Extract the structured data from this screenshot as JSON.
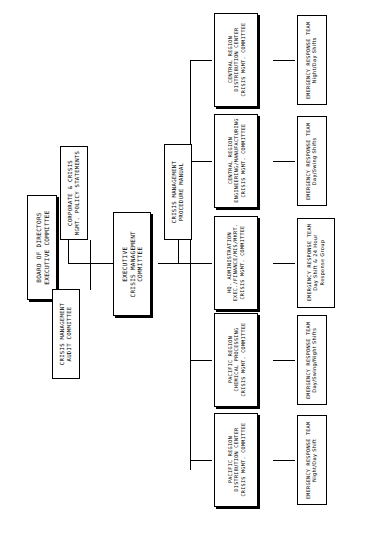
{
  "document": {
    "type": "organization-chart",
    "title": "Crisis Management Organization Chart",
    "orientation": "rotated-90-ccw"
  },
  "chart_data": {
    "type": "diagram",
    "node_count": 15,
    "levels": 4
  },
  "nodes": {
    "board": {
      "lines": [
        "BOARD OF DIRECTORS",
        "EXECUTIVE COMMITTEE"
      ]
    },
    "audit": {
      "lines": [
        "CRISIS MANAGEMENT",
        "AUDIT COMMITTEE"
      ]
    },
    "policy": {
      "lines": [
        "CORPORATE & CRISIS",
        "MGMT. POLICY STATEMENTS"
      ]
    },
    "exec_cm": {
      "lines": [
        "EXECUTIVE",
        "CRISIS MANAGEMENT",
        "COMMITTEE"
      ]
    },
    "manual": {
      "lines": [
        "CRISIS MANAGEMENT",
        "PROCEDURE MANUAL"
      ]
    },
    "central_dist": {
      "lines": [
        "CENTRAL REGION",
        "DISTRIBUTION CENTER",
        "CRISIS MGMT. COMMITTEE"
      ]
    },
    "central_eng": {
      "lines": [
        "CENTRAL REGION",
        "ENGINEERING/MANUFACTURING",
        "CRISIS MGMT. COMMITTEE"
      ]
    },
    "hq_admin": {
      "lines": [
        "HQ. ADMINISTRATION",
        "EXEC./FINANCE/MIS/MKRT.",
        "CRISIS MGMT. COMMITTEE"
      ]
    },
    "pacific_chem": {
      "lines": [
        "PACIFIC REGION",
        "CHEMICAL PROCESSING",
        "CRISIS MGMT. COMMITTEE"
      ]
    },
    "pacific_dist": {
      "lines": [
        "PACIFIC REGION",
        "DISTRIBUTION CENTER",
        "CRISIS MGMT. COMMITTEE"
      ]
    },
    "ert_central_dist": {
      "lines": [
        "EMERGENCY RESPONSE TEAM",
        "Night/Day Shifts"
      ]
    },
    "ert_central_eng": {
      "lines": [
        "EMERGENCY RESPONSE TEAM",
        "Day/Swing Shifts"
      ]
    },
    "ert_hq": {
      "lines": [
        "EMERGENCY RESPONSE TEAM",
        "Day Shift & 24 Hour",
        "Response Group"
      ]
    },
    "ert_pacific_chem": {
      "lines": [
        "EMERGENCY RESPONSE TEAM",
        "Day/Swing/Night Shifts"
      ]
    },
    "ert_pacific_dist": {
      "lines": [
        "EMERGENCY RESPONSE TEAM",
        "Night/Day Shift"
      ]
    }
  },
  "colors": {
    "line": "#000000",
    "background": "#ffffff",
    "text": "#000000"
  }
}
